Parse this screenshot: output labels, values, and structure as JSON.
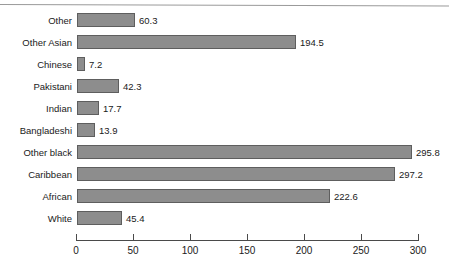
{
  "chart_data": {
    "type": "bar",
    "orientation": "horizontal",
    "title": "",
    "subtitle": "",
    "xlabel": "",
    "ylabel": "",
    "xlim": [
      0,
      300
    ],
    "grid": false,
    "legend": null,
    "xticks": [
      "0",
      "50",
      "100",
      "150",
      "200",
      "250",
      "300"
    ],
    "xtick_values": [
      0,
      50,
      100,
      150,
      200,
      250,
      300
    ],
    "categories": [
      "Other",
      "Other Asian",
      "Chinese",
      "Pakistani",
      "Indian",
      "Bangladeshi",
      "Other black",
      "Caribbean",
      "African",
      "White"
    ],
    "values": [
      60.3,
      194.5,
      7.2,
      42.3,
      17.7,
      13.9,
      295.8,
      297.2,
      222.6,
      45.4
    ],
    "value_labels": [
      "60.3",
      "194.5",
      "7.2",
      "42.3",
      "17.7",
      "13.9",
      "295.8",
      "297.2",
      "222.6",
      "45.4"
    ],
    "bar_pixel_lengths": [
      58,
      219,
      8,
      42,
      22,
      18,
      335,
      318,
      253,
      45
    ],
    "colors": {
      "bar_fill": "#8d8d8d",
      "bar_border": "#5e5e5e",
      "axis": "#4a4a4a",
      "text": "#1a1a1a",
      "background": "#ffffff",
      "top_rule": "#9a9a9a"
    }
  }
}
